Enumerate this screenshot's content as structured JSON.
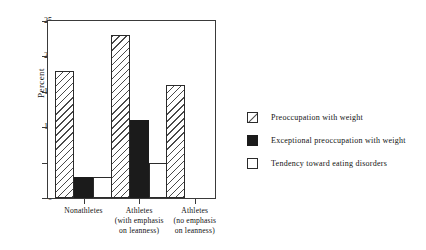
{
  "chart_data": {
    "type": "bar",
    "title": "",
    "xlabel": "",
    "ylabel": "Percent",
    "ylim": [
      0,
      25
    ],
    "yticks": [
      0,
      5,
      10,
      15,
      20,
      25
    ],
    "grid": false,
    "legend_position": "right",
    "categories": [
      "Nonathletes",
      "Athletes (with emphasis on leanness)",
      "Athletes (no emphasis on leanness)"
    ],
    "category_lines": [
      [
        "Nonathletes"
      ],
      [
        "Athletes",
        "(with emphasis",
        "on leanness)"
      ],
      [
        "Athletes",
        "(no emphasis",
        "on leanness)"
      ]
    ],
    "series": [
      {
        "name": "Preoccupation with weight",
        "fill": "hatch",
        "values": [
          18,
          23,
          16
        ]
      },
      {
        "name": "Exceptional preoccupation with weight",
        "fill": "solid",
        "values": [
          3,
          11,
          0
        ]
      },
      {
        "name": "Tendency toward eating disorders",
        "fill": "open",
        "values": [
          3,
          5,
          0
        ]
      }
    ]
  },
  "axis": {
    "y_title": "Percent",
    "y_tick_labels": [
      "0",
      "5",
      "10",
      "15",
      "20",
      "25"
    ]
  },
  "legend": {
    "items": [
      {
        "label": "Preoccupation with weight",
        "swatch": "hatched-square-icon"
      },
      {
        "label": "Exceptional preoccupation with weight",
        "swatch": "filled-square-icon"
      },
      {
        "label": "Tendency toward eating disorders",
        "swatch": "empty-square-icon"
      }
    ]
  },
  "colors": {
    "axis": "#3a3a3a",
    "hatch_stroke": "#4a4a4a",
    "solid_fill": "#1b1b1b",
    "open_fill": "#ffffff",
    "text": "#111111"
  }
}
